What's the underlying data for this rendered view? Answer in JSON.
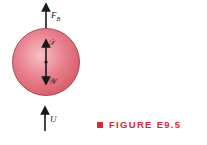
{
  "figure": {
    "caption": "FIGURE E9.5",
    "colors": {
      "sphere": "#e87884",
      "sphere_highlight": "#f6b7bd",
      "sphere_edge": "#8a3a44",
      "arrow": "#1a1a1a",
      "caption": "#d22b3a"
    },
    "forces": [
      {
        "id": "buoyancy",
        "symbol": "F",
        "subscript": "B",
        "direction": "up"
      },
      {
        "id": "drag",
        "symbol": "𝒟",
        "direction": "up"
      },
      {
        "id": "weight",
        "symbol": "𝒲",
        "direction": "down"
      },
      {
        "id": "velocity",
        "symbol": "U",
        "direction": "up"
      }
    ]
  }
}
